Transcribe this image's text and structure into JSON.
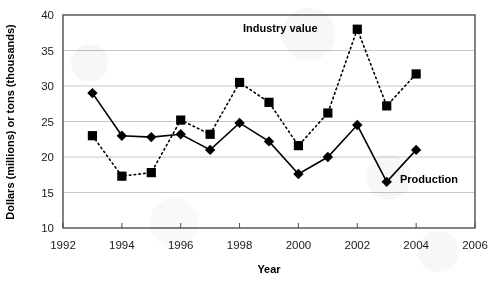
{
  "chart_data": {
    "type": "line",
    "title": "",
    "xlabel": "Year",
    "ylabel": "Dollars (millions) or tons (thousands)",
    "xlim": [
      1992,
      2006
    ],
    "ylim": [
      10,
      40
    ],
    "xticks": [
      1992,
      1994,
      1996,
      1998,
      2000,
      2002,
      2004,
      2006
    ],
    "yticks": [
      10,
      15,
      20,
      25,
      30,
      35,
      40
    ],
    "grid": "horizontal",
    "legend_position": "inline-annotations",
    "x": [
      1993,
      1994,
      1995,
      1996,
      1997,
      1998,
      1999,
      2000,
      2001,
      2002,
      2003,
      2004
    ],
    "series": [
      {
        "name": "Industry value",
        "marker": "square",
        "line_style": "dotted",
        "color": "#000000",
        "values": [
          23.0,
          17.3,
          17.8,
          25.2,
          23.2,
          30.5,
          27.7,
          21.6,
          26.2,
          38.0,
          27.2,
          31.7
        ]
      },
      {
        "name": "Production",
        "marker": "diamond",
        "line_style": "solid",
        "color": "#000000",
        "values": [
          29.0,
          23.0,
          22.8,
          23.2,
          21.0,
          24.8,
          22.2,
          17.6,
          20.0,
          24.5,
          16.5,
          21.0
        ]
      }
    ],
    "annotations": [
      {
        "text": "Industry value",
        "x_px": 243,
        "y_px": 32
      },
      {
        "text": "Production",
        "x_px": 400,
        "y_px": 183
      }
    ]
  },
  "axes": {
    "y_title": "Dollars (millions) or tons (thousands)",
    "x_title": "Year",
    "y_tick_labels": [
      "40",
      "35",
      "30",
      "25",
      "20",
      "15",
      "10"
    ],
    "x_tick_labels": [
      "1992",
      "1994",
      "1996",
      "1998",
      "2000",
      "2002",
      "2004",
      "2006"
    ]
  },
  "legend": {
    "industry_value_label": "Industry value",
    "production_label": "Production"
  },
  "colors": {
    "ink": "#000000",
    "gridline": "#c8c8c8",
    "frame": "#4d4d4d",
    "background": "#ffffff"
  }
}
